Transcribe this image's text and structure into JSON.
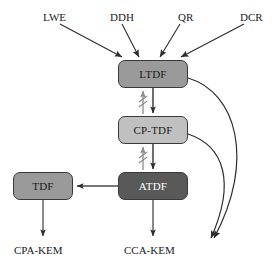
{
  "diagram": {
    "canvas": {
      "width": 280,
      "height": 264
    },
    "colors": {
      "background": "#ffffff",
      "stroke": "#3a3a3a",
      "text_dark": "#1b1b1b",
      "text_light": "#ffffff",
      "ltdf_fill": "#9a9a9a",
      "cptdf_fill": "#c0c0c0",
      "atdf_fill": "#595959",
      "tdf_fill": "#9a9a9a",
      "cross_mark": "#8c8c8c"
    },
    "assumptions": [
      {
        "id": "lwe",
        "label": "LWE",
        "x": 43,
        "y": 12
      },
      {
        "id": "ddh",
        "label": "DDH",
        "x": 110,
        "y": 12
      },
      {
        "id": "qr",
        "label": "QR",
        "x": 180,
        "y": 12
      },
      {
        "id": "dcr",
        "label": "DCR",
        "x": 240,
        "y": 12
      }
    ],
    "nodes": [
      {
        "id": "ltdf",
        "label": "LTDF",
        "x": 118,
        "y": 60,
        "w": 70,
        "h": 28,
        "fill": "#9a9a9a",
        "text": "#1b1b1b"
      },
      {
        "id": "cptdf",
        "label": "CP-TDF",
        "x": 118,
        "y": 116,
        "w": 70,
        "h": 28,
        "fill": "#c0c0c0",
        "text": "#1b1b1b"
      },
      {
        "id": "atdf",
        "label": "ATDF",
        "x": 118,
        "y": 172,
        "w": 70,
        "h": 28,
        "fill": "#595959",
        "text": "#ffffff"
      },
      {
        "id": "tdf",
        "label": "TDF",
        "x": 13,
        "y": 172,
        "w": 60,
        "h": 28,
        "fill": "#9a9a9a",
        "text": "#1b1b1b"
      }
    ],
    "outputs": [
      {
        "id": "cpa-kem",
        "label": "CPA-KEM",
        "x": 14,
        "y": 245
      },
      {
        "id": "cca-kem",
        "label": "CCA-KEM",
        "x": 126,
        "y": 245
      }
    ],
    "edges": [
      {
        "id": "lwe-to-ltdf",
        "from": "LWE",
        "to": "LTDF",
        "kind": "straight-arrow",
        "crossed": false
      },
      {
        "id": "ddh-to-ltdf",
        "from": "DDH",
        "to": "LTDF",
        "kind": "straight-arrow",
        "crossed": false
      },
      {
        "id": "qr-to-ltdf",
        "from": "QR",
        "to": "LTDF",
        "kind": "straight-arrow",
        "crossed": false
      },
      {
        "id": "dcr-to-ltdf",
        "from": "DCR",
        "to": "LTDF",
        "kind": "straight-arrow",
        "crossed": false
      },
      {
        "id": "ltdf-to-cptdf",
        "from": "LTDF",
        "to": "CP-TDF",
        "kind": "straight-arrow",
        "crossed": false
      },
      {
        "id": "cptdf-to-ltdf",
        "from": "CP-TDF",
        "to": "LTDF",
        "kind": "crossed-arrow",
        "crossed": true
      },
      {
        "id": "cptdf-to-atdf",
        "from": "CP-TDF",
        "to": "ATDF",
        "kind": "straight-arrow",
        "crossed": false
      },
      {
        "id": "atdf-to-cptdf",
        "from": "ATDF",
        "to": "CP-TDF",
        "kind": "crossed-arrow",
        "crossed": true
      },
      {
        "id": "atdf-to-tdf",
        "from": "ATDF",
        "to": "TDF",
        "kind": "straight-arrow",
        "crossed": false
      },
      {
        "id": "tdf-to-cpakem",
        "from": "TDF",
        "to": "CPA-KEM",
        "kind": "straight-arrow",
        "crossed": false
      },
      {
        "id": "atdf-to-ccakem",
        "from": "ATDF",
        "to": "CCA-KEM",
        "kind": "straight-arrow",
        "crossed": false
      },
      {
        "id": "ltdf-to-ccakem",
        "from": "LTDF",
        "to": "CCA-KEM",
        "kind": "curved-arrow",
        "crossed": false
      },
      {
        "id": "cptdf-to-ccakem",
        "from": "CP-TDF",
        "to": "CCA-KEM",
        "kind": "curved-arrow",
        "crossed": false
      }
    ]
  }
}
